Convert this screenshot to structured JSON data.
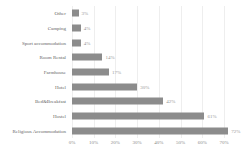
{
  "chart_data": {
    "type": "bar",
    "orientation": "horizontal",
    "title": "",
    "xlabel": "",
    "ylabel": "",
    "categories": [
      "Other",
      "Camping",
      "Sport accommodation",
      "Room Rental",
      "Farmhouse",
      "Hotel",
      "Bed&Breakfast",
      "Hostel",
      "Religious Accommodation"
    ],
    "values": [
      3,
      4,
      4,
      14,
      17,
      30,
      42,
      61,
      72
    ],
    "value_labels": [
      "3%",
      "4%",
      "4%",
      "14%",
      "17%",
      "30%",
      "42%",
      "61%",
      "72%"
    ],
    "xlim": [
      0,
      70
    ],
    "x_ticks": [
      0,
      10,
      20,
      30,
      40,
      50,
      60,
      70
    ],
    "x_tick_labels": [
      "0%",
      "10%",
      "20%",
      "30%",
      "40%",
      "50%",
      "60%",
      "70%"
    ],
    "grid": "vertical",
    "legend": "none",
    "colors": {
      "bar": "#8c8c8c",
      "value_label": "#999999",
      "category_label": "#666666",
      "tick_label": "#8a8a8a",
      "gridline": "#eeeeee",
      "background": "#ffffff"
    }
  }
}
